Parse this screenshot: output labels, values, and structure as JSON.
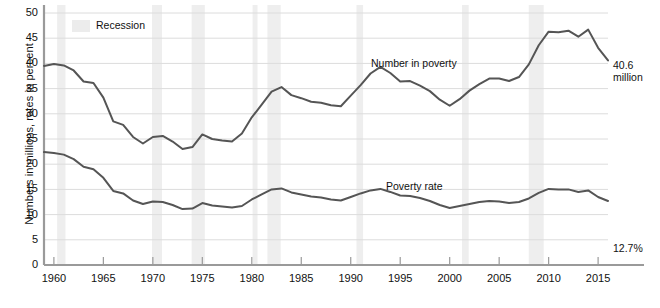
{
  "chart_data": {
    "type": "line",
    "title": "",
    "xlabel": "",
    "ylabel": "Numbers in millions, rates in percent",
    "xlim": [
      1959,
      2016
    ],
    "ylim": [
      0,
      50
    ],
    "yticks": [
      0,
      5,
      10,
      15,
      20,
      25,
      30,
      35,
      40,
      45,
      50
    ],
    "xticks": [
      1960,
      1965,
      1970,
      1975,
      1980,
      1985,
      1990,
      1995,
      2000,
      2005,
      2010,
      2015
    ],
    "grid": true,
    "legend_position": "top-left",
    "legend": [
      {
        "label": "Recession",
        "swatch_color": "#ececec"
      }
    ],
    "annotations": [
      {
        "text": "Number in poverty",
        "x": 1990,
        "y": 38.5
      },
      {
        "text": "Poverty rate",
        "x": 1994,
        "y": 18.5
      },
      {
        "text": "40.6",
        "x": 2016.6,
        "y": 43.5
      },
      {
        "text": "million",
        "x": 2016.6,
        "y": 41.0
      },
      {
        "text": "12.7%",
        "x": 2016.6,
        "y": 11.0
      }
    ],
    "recession_bands": [
      {
        "start": 1960.33,
        "end": 1961.17
      },
      {
        "start": 1969.92,
        "end": 1970.92
      },
      {
        "start": 1973.92,
        "end": 1975.25
      },
      {
        "start": 1980.08,
        "end": 1980.58
      },
      {
        "start": 1981.58,
        "end": 1982.92
      },
      {
        "start": 1990.58,
        "end": 1991.25
      },
      {
        "start": 2001.25,
        "end": 2001.92
      },
      {
        "start": 2007.99,
        "end": 2009.5
      }
    ],
    "series": [
      {
        "name": "Number in poverty",
        "units": "millions",
        "color": "#555555",
        "x": [
          1959,
          1960,
          1961,
          1962,
          1963,
          1964,
          1965,
          1966,
          1967,
          1968,
          1969,
          1970,
          1971,
          1972,
          1973,
          1974,
          1975,
          1976,
          1977,
          1978,
          1979,
          1980,
          1981,
          1982,
          1983,
          1984,
          1985,
          1986,
          1987,
          1988,
          1989,
          1990,
          1991,
          1992,
          1993,
          1994,
          1995,
          1996,
          1997,
          1998,
          1999,
          2000,
          2001,
          2002,
          2003,
          2004,
          2005,
          2006,
          2007,
          2008,
          2009,
          2010,
          2011,
          2012,
          2013,
          2014,
          2015,
          2016
        ],
        "values": [
          39.5,
          39.9,
          39.6,
          38.6,
          36.4,
          36.1,
          33.2,
          28.5,
          27.8,
          25.4,
          24.1,
          25.4,
          25.6,
          24.5,
          23.0,
          23.4,
          25.9,
          25.0,
          24.7,
          24.5,
          26.1,
          29.3,
          31.8,
          34.4,
          35.3,
          33.7,
          33.1,
          32.4,
          32.2,
          31.7,
          31.5,
          33.6,
          35.7,
          38.0,
          39.3,
          38.1,
          36.4,
          36.5,
          35.6,
          34.5,
          32.8,
          31.6,
          32.9,
          34.6,
          35.9,
          37.0,
          37.0,
          36.5,
          37.3,
          39.8,
          43.6,
          46.3,
          46.2,
          46.5,
          45.3,
          46.7,
          43.1,
          40.6
        ]
      },
      {
        "name": "Poverty rate",
        "units": "percent",
        "color": "#555555",
        "x": [
          1959,
          1960,
          1961,
          1962,
          1963,
          1964,
          1965,
          1966,
          1967,
          1968,
          1969,
          1970,
          1971,
          1972,
          1973,
          1974,
          1975,
          1976,
          1977,
          1978,
          1979,
          1980,
          1981,
          1982,
          1983,
          1984,
          1985,
          1986,
          1987,
          1988,
          1989,
          1990,
          1991,
          1992,
          1993,
          1994,
          1995,
          1996,
          1997,
          1998,
          1999,
          2000,
          2001,
          2002,
          2003,
          2004,
          2005,
          2006,
          2007,
          2008,
          2009,
          2010,
          2011,
          2012,
          2013,
          2014,
          2015,
          2016
        ],
        "values": [
          22.4,
          22.2,
          21.9,
          21.0,
          19.5,
          19.0,
          17.3,
          14.7,
          14.2,
          12.8,
          12.1,
          12.6,
          12.5,
          11.9,
          11.1,
          11.2,
          12.3,
          11.8,
          11.6,
          11.4,
          11.7,
          13.0,
          14.0,
          15.0,
          15.2,
          14.4,
          14.0,
          13.6,
          13.4,
          13.0,
          12.8,
          13.5,
          14.2,
          14.8,
          15.1,
          14.5,
          13.8,
          13.7,
          13.3,
          12.7,
          11.9,
          11.3,
          11.7,
          12.1,
          12.5,
          12.7,
          12.6,
          12.3,
          12.5,
          13.2,
          14.3,
          15.1,
          15.0,
          15.0,
          14.5,
          14.8,
          13.5,
          12.7
        ]
      }
    ]
  },
  "axis": {
    "y_tick_labels": [
      "0",
      "5",
      "10",
      "15",
      "20",
      "25",
      "30",
      "35",
      "40",
      "45",
      "50"
    ],
    "x_tick_labels": [
      "1960",
      "1965",
      "1970",
      "1975",
      "1980",
      "1985",
      "1990",
      "1995",
      "2000",
      "2005",
      "2010",
      "2015"
    ],
    "y_axis_title": "Numbers in millions, rates in percent"
  },
  "labels": {
    "recession_legend": "Recession",
    "number_in_poverty": "Number in poverty",
    "poverty_rate": "Poverty rate",
    "end_number_value": "40.6",
    "end_number_unit": "million",
    "end_rate_value": "12.7%"
  },
  "colors": {
    "line": "#555555",
    "grid": "#dcdcdc",
    "axis": "#9a9a9a",
    "recession_band": "#eeeeee",
    "text": "#111111",
    "background": "#ffffff"
  }
}
